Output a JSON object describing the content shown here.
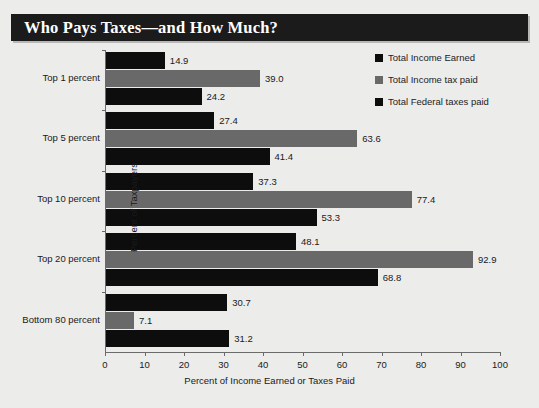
{
  "title": "Who Pays Taxes—and How Much?",
  "theme": {
    "background": "#ececeb",
    "banner": "#1b1b1b",
    "banner_text": "#ffffff",
    "axis": "#6b6b6b",
    "series_income_earned": "#0d0d0d",
    "series_income_tax": "#696969",
    "series_federal_taxes": "#0d0d0d"
  },
  "legend": {
    "items": [
      {
        "label": "Total Income Earned",
        "color": "#0d0d0d"
      },
      {
        "label": "Total Income tax paid",
        "color": "#696969"
      },
      {
        "label": "Total Federal taxes paid",
        "color": "#0d0d0d"
      }
    ]
  },
  "chart_data": {
    "type": "bar",
    "orientation": "horizontal",
    "title": "Who Pays Taxes—and How Much?",
    "xlabel": "Percent of Income Earned or Taxes Paid",
    "ylabel": "Percent of Taxpayers",
    "xlim": [
      0,
      100
    ],
    "xticks": [
      0,
      10,
      20,
      30,
      40,
      50,
      60,
      70,
      80,
      90,
      100
    ],
    "grid": false,
    "legend_position": "top-right",
    "categories": [
      "Top 1 percent",
      "Top 5 percent",
      "Top 10 percent",
      "Top 20 percent",
      "Bottom 80 percent"
    ],
    "series": [
      {
        "name": "Total Income Earned",
        "color": "#0d0d0d",
        "values": [
          14.9,
          27.4,
          37.3,
          48.1,
          30.7
        ]
      },
      {
        "name": "Total Income tax paid",
        "color": "#696969",
        "values": [
          39.0,
          63.6,
          77.4,
          92.9,
          7.1
        ]
      },
      {
        "name": "Total Federal taxes paid",
        "color": "#0d0d0d",
        "values": [
          24.2,
          41.4,
          53.3,
          68.8,
          31.2
        ]
      }
    ],
    "data_labels": {
      "Top 1 percent": [
        "14.9",
        "39.0",
        "24.2"
      ],
      "Top 5 percent": [
        "27.4",
        "63.6",
        "41.4"
      ],
      "Top 10 percent": [
        "37.3",
        "77.4",
        "53.3"
      ],
      "Top 20 percent": [
        "48.1",
        "92.9",
        "68.8"
      ],
      "Bottom 80 percent": [
        "30.7",
        "7.1",
        "31.2"
      ]
    }
  }
}
